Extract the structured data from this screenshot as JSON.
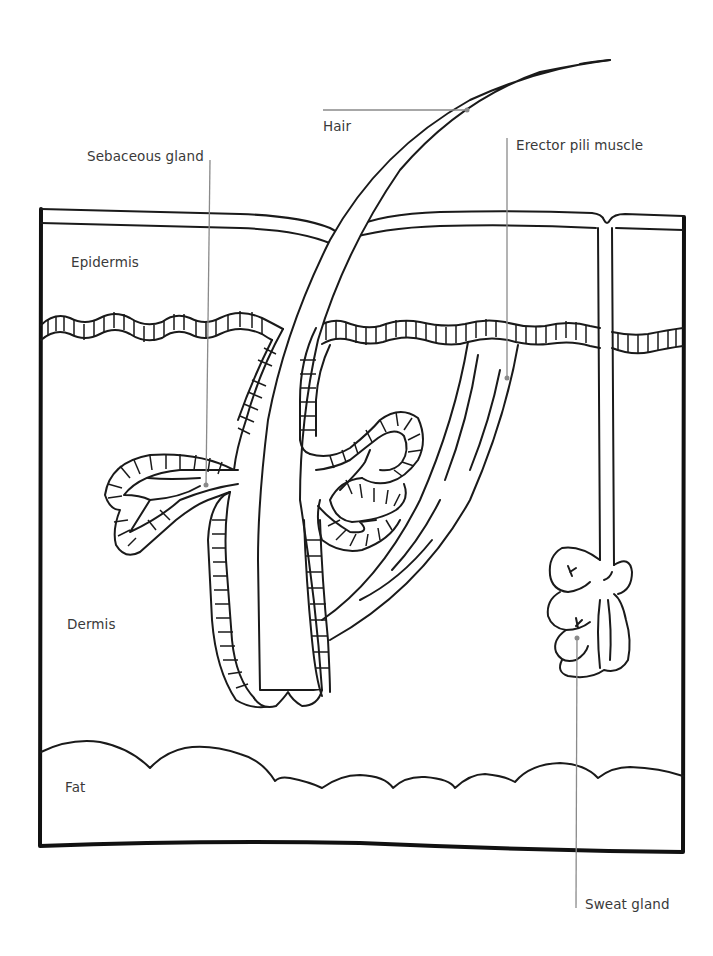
{
  "diagram": {
    "colors": {
      "ink": "#1a1a1a",
      "leader_line": "#8a8a8a",
      "label_text": "#3a3a3a",
      "background": "#ffffff"
    },
    "layer_labels": [
      {
        "id": "epidermis",
        "text": "Epidermis",
        "x": 71,
        "y": 254
      },
      {
        "id": "dermis",
        "text": "Dermis",
        "x": 67,
        "y": 616
      },
      {
        "id": "fat",
        "text": "Fat",
        "x": 65,
        "y": 779
      }
    ],
    "callouts": [
      {
        "id": "hair",
        "text": "Hair",
        "x": 323,
        "y": 118,
        "leader": {
          "x1": 323,
          "y1": 110,
          "x2": 467,
          "y2": 110
        }
      },
      {
        "id": "sebaceous-gland",
        "text": "Sebaceous gland",
        "x": 87,
        "y": 148,
        "leader": {
          "x1": 209,
          "y1": 160,
          "x2": 206,
          "y2": 485
        }
      },
      {
        "id": "erector-pili-muscle",
        "text": "Erector pili muscle",
        "x": 516,
        "y": 137,
        "leader": {
          "x1": 507,
          "y1": 138,
          "x2": 507,
          "y2": 378
        }
      },
      {
        "id": "sweat-gland",
        "text": "Sweat gland",
        "x": 585,
        "y": 897,
        "leader": {
          "x1": 576,
          "y1": 638,
          "x2": 576,
          "y2": 908
        }
      }
    ]
  }
}
